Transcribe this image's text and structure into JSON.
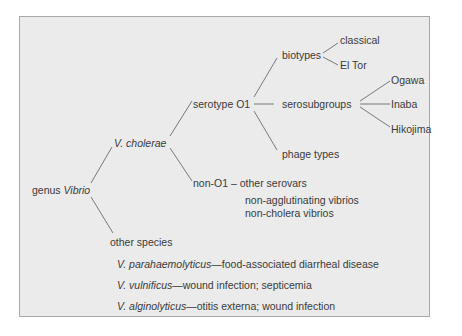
{
  "diagram": {
    "root": {
      "prefix": "genus",
      "name": "Vibrio"
    },
    "cholerae": "V. cholerae",
    "serotype_o1": "serotype O1",
    "non_o1": "non-O1 – other serovars",
    "non_o1_notes": [
      "non-agglutinating vibrios",
      "non-cholera vibrios"
    ],
    "biotypes": {
      "label": "biotypes",
      "children": [
        "classical",
        "El Tor"
      ]
    },
    "serosubgroups": {
      "label": "serosubgroups",
      "children": [
        "Ogawa",
        "Inaba",
        "Hikojima"
      ]
    },
    "phage_types": "phage types",
    "other_species": {
      "label": "other species",
      "items": [
        {
          "name": "V. parahaemolyticus",
          "desc": "—food-associated diarrheal disease"
        },
        {
          "name": "V. vulnificus",
          "desc": "—wound infection; septicemia"
        },
        {
          "name": "V. alginolyticus",
          "desc": "—otitis externa; wound infection"
        }
      ]
    }
  },
  "colors": {
    "panel_bg": "#ebebeb",
    "border": "#a8a8a8",
    "text": "#3a3a3a",
    "line": "#555555"
  }
}
